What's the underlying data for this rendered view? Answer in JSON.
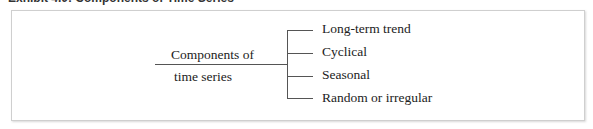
{
  "title": "Exhibit 4.0: Components of Time Series",
  "root": {
    "line1": "Components of",
    "line2": "time series"
  },
  "branches": [
    {
      "label": "Long-term trend"
    },
    {
      "label": "Cyclical"
    },
    {
      "label": "Seasonal"
    },
    {
      "label": "Random or irregular"
    }
  ],
  "colors": {
    "line": "#555555",
    "frame_border": "#cfcfcf",
    "text": "#222222"
  }
}
